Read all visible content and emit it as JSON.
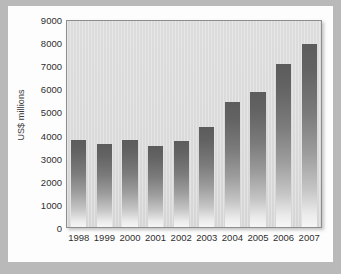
{
  "chart_data": {
    "type": "bar",
    "title": "",
    "subtitle": "",
    "xlabel": "",
    "ylabel": "US$ millions",
    "categories": [
      "1998",
      "1999",
      "2000",
      "2001",
      "2002",
      "2003",
      "2004",
      "2005",
      "2006",
      "2007"
    ],
    "values": [
      3800,
      3650,
      3800,
      3550,
      3750,
      4350,
      5450,
      5900,
      7100,
      7950
    ],
    "series": [
      {
        "name": "US$ millions",
        "values": [
          3800,
          3650,
          3800,
          3550,
          3750,
          4350,
          5450,
          5900,
          7100,
          7950
        ]
      }
    ],
    "ylim": [
      0,
      9000
    ],
    "ytick_values": [
      0,
      1000,
      2000,
      3000,
      4000,
      5000,
      6000,
      7000,
      8000,
      9000
    ],
    "ytick_labels": [
      "0",
      "1000",
      "2000",
      "3000",
      "4000",
      "5000",
      "6000",
      "7000",
      "8000",
      "9000"
    ],
    "xtick_labels": [
      "1998",
      "1999",
      "2000",
      "2001",
      "2002",
      "2003",
      "2004",
      "2005",
      "2006",
      "2007"
    ],
    "grid": false,
    "legend": false,
    "legend_position": "none",
    "annotations": [],
    "colors": {
      "bar_top": "#5c5c5c",
      "bar_bottom": "#f6f6f6",
      "plot_background": "#dadada",
      "plot_border": "#8e8e8e",
      "card_background": "#fdfdfd",
      "page_background": "#b9b9b9",
      "text": "#2f2f2f"
    }
  }
}
